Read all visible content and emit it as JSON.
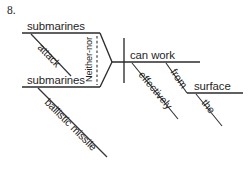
{
  "exercise": {
    "number": "8.",
    "type": "reed-kellogg-sentence-diagram"
  },
  "diagram": {
    "conjunction": "Neither-nor",
    "branches": {
      "top": {
        "subject": "submarines",
        "modifier": "attack"
      },
      "bottom": {
        "subject": "submarines",
        "modifier": "ballistic missile"
      }
    },
    "predicate": {
      "verb": "can work",
      "adverb": "effectively",
      "preposition": "from",
      "object_of_preposition": "surface",
      "article": "the"
    }
  },
  "colors": {
    "ink": "#1f1f1f",
    "line": "#2b2b2b",
    "background": "#ffffff"
  }
}
